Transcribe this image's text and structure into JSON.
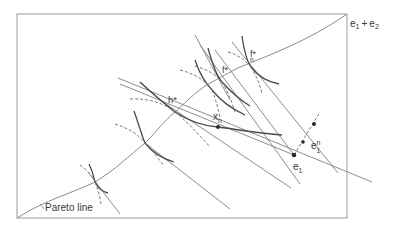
{
  "figure": {
    "type": "economic-diagram",
    "labels": {
      "corner": "e",
      "corner_sub1": "1",
      "corner_plus": "+",
      "corner_e2": "e",
      "corner_sub2": "2",
      "pareto": "Pareto line",
      "h_star": "h*",
      "f_star": "f*",
      "fn_star_main": "f*",
      "fn_star_sub": "n",
      "xn_main": "x",
      "xn_sub": "n",
      "e1_main": "e",
      "e1_sub": "1",
      "e1n_main": "e",
      "e1n_sub": "1",
      "e1n_sup": "n"
    },
    "colors": {
      "box": "#9a9a9a",
      "curve": "#8c8c8c",
      "indifference": "#4a4a4a",
      "dashed": "#6a6a6a",
      "line": "#808080",
      "dot": "#2a2a2a"
    }
  }
}
